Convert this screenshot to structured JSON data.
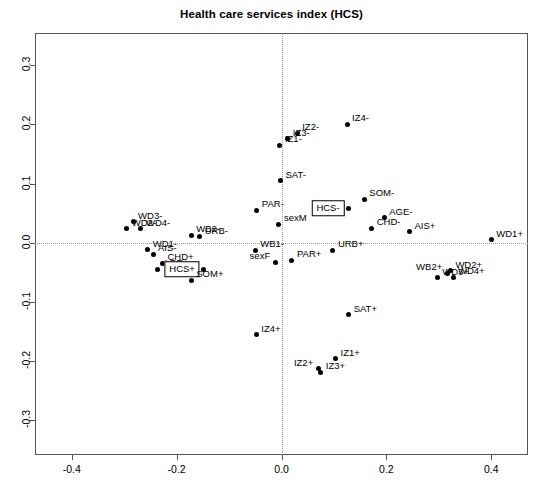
{
  "chart_data": {
    "type": "scatter",
    "title": "Health care services index (HCS)",
    "xlabel": "",
    "ylabel": "",
    "xlim": [
      -0.47,
      0.47
    ],
    "ylim": [
      -0.36,
      0.355
    ],
    "grid": "dotted zero-reference lines at x=0 and y=0",
    "legend": "none",
    "xticks": [
      "-0.4",
      "-0.2",
      "0.0",
      "0.2",
      "0.4"
    ],
    "xtickvalues": [
      -0.4,
      -0.2,
      0.0,
      0.2,
      0.4
    ],
    "yticks": [
      "0.3",
      "0.2",
      "0.1",
      "0.0",
      "-0.1",
      "-0.2",
      "-0.3"
    ],
    "ytickvalues": [
      0.3,
      0.2,
      0.1,
      0.0,
      -0.1,
      -0.2,
      -0.3
    ],
    "points": [
      {
        "label": "IZ4-",
        "x": 0.125,
        "y": 0.2,
        "pos": "right",
        "boxed": false
      },
      {
        "label": "IZ2-",
        "x": 0.03,
        "y": 0.185,
        "pos": "right",
        "boxed": false
      },
      {
        "label": "IZ3-",
        "x": 0.012,
        "y": 0.176,
        "pos": "right",
        "boxed": false
      },
      {
        "label": "IZ1-",
        "x": -0.003,
        "y": 0.165,
        "pos": "right",
        "boxed": false
      },
      {
        "label": "SAT-",
        "x": -0.002,
        "y": 0.105,
        "pos": "right",
        "boxed": false
      },
      {
        "label": "SOM-",
        "x": 0.158,
        "y": 0.073,
        "pos": "right",
        "boxed": false
      },
      {
        "label": "HCS-",
        "x": 0.128,
        "y": 0.058,
        "pos": "left",
        "boxed": true
      },
      {
        "label": "PAR-",
        "x": -0.047,
        "y": 0.055,
        "pos": "right",
        "boxed": false
      },
      {
        "label": "AGE-",
        "x": 0.196,
        "y": 0.042,
        "pos": "right",
        "boxed": false
      },
      {
        "label": "sexM",
        "x": -0.005,
        "y": 0.031,
        "pos": "right",
        "boxed": false
      },
      {
        "label": "WD3-",
        "x": -0.283,
        "y": 0.035,
        "pos": "right",
        "boxed": false
      },
      {
        "label": "WD2-",
        "x": -0.295,
        "y": 0.023,
        "pos": "right",
        "boxed": false
      },
      {
        "label": "WD4-",
        "x": -0.268,
        "y": 0.023,
        "pos": "right",
        "boxed": false
      },
      {
        "label": "CHD-",
        "x": 0.172,
        "y": 0.024,
        "pos": "right",
        "boxed": false
      },
      {
        "label": "AIS+",
        "x": 0.244,
        "y": 0.018,
        "pos": "right",
        "boxed": false
      },
      {
        "label": "WB2-",
        "x": -0.172,
        "y": 0.012,
        "pos": "right",
        "boxed": false
      },
      {
        "label": "URB-",
        "x": -0.156,
        "y": 0.01,
        "pos": "right",
        "boxed": false
      },
      {
        "label": "WD1+",
        "x": 0.4,
        "y": 0.005,
        "pos": "right",
        "boxed": false
      },
      {
        "label": "WD1-",
        "x": -0.255,
        "y": -0.012,
        "pos": "right",
        "boxed": false
      },
      {
        "label": "WB1-",
        "x": -0.05,
        "y": -0.013,
        "pos": "right",
        "boxed": false
      },
      {
        "label": "URB+",
        "x": 0.098,
        "y": -0.013,
        "pos": "right",
        "boxed": false
      },
      {
        "label": "AIS-",
        "x": -0.245,
        "y": -0.02,
        "pos": "right",
        "boxed": false
      },
      {
        "label": "sexF",
        "x": -0.012,
        "y": -0.033,
        "pos": "left",
        "boxed": false
      },
      {
        "label": "PAR+",
        "x": 0.02,
        "y": -0.03,
        "pos": "right",
        "boxed": false
      },
      {
        "label": "CHD+",
        "x": -0.227,
        "y": -0.035,
        "pos": "right",
        "boxed": false
      },
      {
        "label": "AGE+",
        "x": -0.236,
        "y": -0.045,
        "pos": "right",
        "boxed": false
      },
      {
        "label": "HCS+",
        "x": -0.148,
        "y": -0.045,
        "pos": "left",
        "boxed": true
      },
      {
        "label": "WB2+",
        "x": 0.316,
        "y": -0.052,
        "pos": "left",
        "boxed": false
      },
      {
        "label": "WD2+",
        "x": 0.322,
        "y": -0.048,
        "pos": "right",
        "boxed": false
      },
      {
        "label": "WD3+",
        "x": 0.297,
        "y": -0.06,
        "pos": "right",
        "boxed": false
      },
      {
        "label": "WD4+",
        "x": 0.327,
        "y": -0.059,
        "pos": "right",
        "boxed": false
      },
      {
        "label": "SOM+",
        "x": -0.172,
        "y": -0.064,
        "pos": "right",
        "boxed": false
      },
      {
        "label": "SAT+",
        "x": 0.128,
        "y": -0.122,
        "pos": "right",
        "boxed": false
      },
      {
        "label": "IZ4+",
        "x": -0.048,
        "y": -0.156,
        "pos": "right",
        "boxed": false
      },
      {
        "label": "IZ1+",
        "x": 0.103,
        "y": -0.197,
        "pos": "right",
        "boxed": false
      },
      {
        "label": "IZ2+",
        "x": 0.07,
        "y": -0.214,
        "pos": "left",
        "boxed": false
      },
      {
        "label": "IZ3+",
        "x": 0.075,
        "y": -0.22,
        "pos": "right",
        "boxed": false
      }
    ]
  }
}
